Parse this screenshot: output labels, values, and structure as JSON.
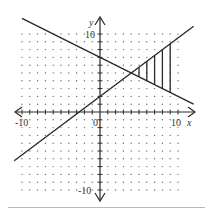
{
  "chart_data": {
    "type": "line",
    "title": "",
    "xlabel": "x",
    "ylabel": "y",
    "xlim": [
      -10,
      10
    ],
    "ylim": [
      -10,
      10
    ],
    "grid": "dotted",
    "tick_labels": {
      "x": [
        "-10",
        "0",
        "10"
      ],
      "y": [
        "10",
        "-10"
      ]
    },
    "series": [
      {
        "name": "decreasing line",
        "equation": "y = -x/2 + 7",
        "x": [
          -10,
          12
        ],
        "y": [
          12,
          1
        ]
      },
      {
        "name": "increasing line",
        "equation": "y = 3x/4 + 2",
        "x": [
          -11,
          12
        ],
        "y": [
          -6.25,
          11
        ]
      }
    ],
    "intersection": {
      "x": 4,
      "y": 5
    },
    "shaded_region": {
      "description": "Region between the two lines from x = 4 to x = 9, hatched with vertical lines",
      "x_range": [
        4,
        9
      ],
      "hatch_x": [
        5,
        6,
        7,
        8,
        9
      ]
    }
  },
  "labels": {
    "x_axis": "x",
    "y_axis": "y",
    "x_min": "-10",
    "x_max": "10",
    "origin": "0",
    "y_max": "10",
    "y_min": "-10"
  },
  "colors": {
    "ink": "#2a2a2a",
    "grid_dot": "#6a6a6a",
    "divider": "#b8b8b8"
  }
}
